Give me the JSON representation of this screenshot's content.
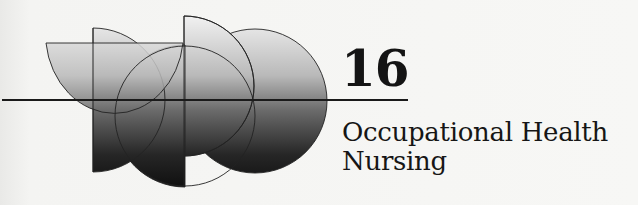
{
  "chapter": {
    "number": "16",
    "title_line_1": "Occupational Health",
    "title_line_2": "Nursing"
  },
  "emblem": {
    "description": "Overlapping gradient semicircles and circles divided by a horizontal rule",
    "gradient_top_color": "#f2f2f2",
    "gradient_bottom_color": "#111111",
    "rule_color": "#1a1a1a"
  }
}
